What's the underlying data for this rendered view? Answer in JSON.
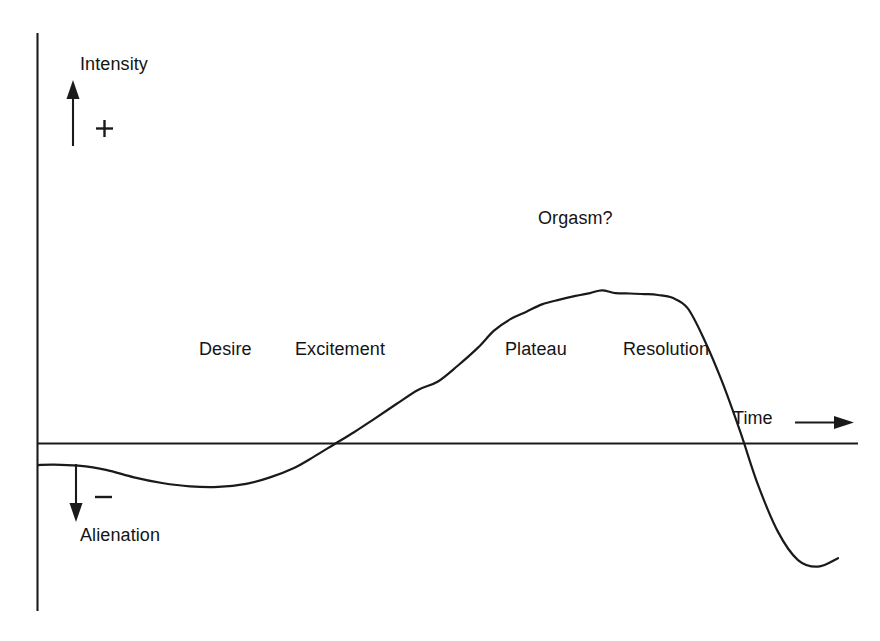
{
  "chart_data": {
    "type": "line",
    "title": "",
    "subtitle": "",
    "xlabel": "Time",
    "ylabel": "Intensity",
    "grid": false,
    "legend": null,
    "axes": {
      "x_axis": {
        "label": "Time",
        "direction_arrow": "right",
        "tick_labels": [],
        "baseline_meaning": "zero / neutral"
      },
      "y_axis": {
        "label": "Intensity",
        "positive_sign": "+",
        "negative_sign": "−",
        "positive_direction_label": "Intensity",
        "negative_direction_label": "Alienation",
        "tick_labels": []
      }
    },
    "annotations": [
      {
        "text": "Desire",
        "phase": 1,
        "x_frac": 0.2,
        "y_frac": 0.16
      },
      {
        "text": "Excitement",
        "phase": 2,
        "x_frac": 0.32,
        "y_frac": 0.16
      },
      {
        "text": "Orgasm?",
        "phase": 3,
        "x_frac": 0.6,
        "y_frac": 0.52
      },
      {
        "text": "Plateau",
        "phase": 4,
        "x_frac": 0.57,
        "y_frac": 0.16
      },
      {
        "text": "Resolution",
        "phase": 5,
        "x_frac": 0.71,
        "y_frac": 0.16
      }
    ],
    "series": [
      {
        "name": "Sexual response intensity",
        "x": [
          0.0,
          0.02,
          0.05,
          0.085,
          0.12,
          0.155,
          0.19,
          0.225,
          0.26,
          0.29,
          0.32,
          0.345,
          0.37,
          0.395,
          0.42,
          0.448,
          0.475,
          0.5,
          0.525,
          0.55,
          0.57,
          0.59,
          0.61,
          0.63,
          0.652,
          0.672,
          0.69,
          0.705,
          0.722,
          0.74,
          0.758,
          0.775,
          0.793,
          0.812,
          0.832,
          0.855,
          0.878,
          0.9,
          0.925,
          0.95,
          0.975,
          1.0
        ],
        "y": [
          -0.115,
          -0.112,
          -0.118,
          -0.14,
          -0.18,
          -0.21,
          -0.228,
          -0.231,
          -0.215,
          -0.18,
          -0.13,
          -0.07,
          -0.005,
          0.06,
          0.13,
          0.21,
          0.285,
          0.33,
          0.415,
          0.51,
          0.6,
          0.66,
          0.7,
          0.74,
          0.765,
          0.785,
          0.8,
          0.815,
          0.8,
          0.798,
          0.795,
          0.79,
          0.775,
          0.72,
          0.56,
          0.33,
          0.06,
          -0.22,
          -0.47,
          -0.62,
          -0.655,
          -0.61
        ],
        "ylim": [
          -1.0,
          1.0
        ],
        "xlim": [
          0.0,
          1.0
        ]
      }
    ],
    "phases": [
      "Desire",
      "Excitement",
      "Orgasm?",
      "Plateau",
      "Resolution"
    ]
  },
  "labels": {
    "intensity": "Intensity",
    "alienation": "Alienation",
    "time": "Time",
    "plus": "+",
    "minus": "−",
    "desire": "Desire",
    "excitement": "Excitement",
    "orgasm": "Orgasm?",
    "plateau": "Plateau",
    "resolution": "Resolution"
  },
  "icons": {
    "up_arrow": "up-arrow-icon",
    "down_arrow": "down-arrow-icon",
    "right_arrow": "right-arrow-icon"
  },
  "colors": {
    "ink": "#1a1a1a",
    "background": "#ffffff"
  }
}
